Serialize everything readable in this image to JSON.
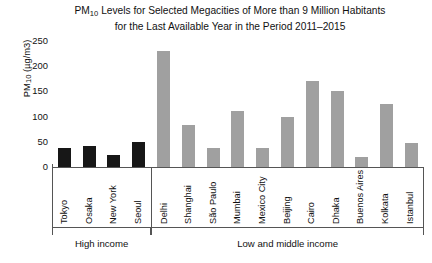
{
  "chart": {
    "title_line1_pre": "PM",
    "title_line1_sub": "10",
    "title_line1_post": " Levels for Selected Megacities of More than 9 Million Habitants",
    "title_line2": "for the Last Available Year in the Period 2011–2015",
    "y_axis_label_pre": "PM",
    "y_axis_label_sub": "10",
    "y_axis_label_post": " (µg/m3)",
    "colors": {
      "high_income_bar": "#171717",
      "low_middle_income_bar": "#a0a0a0",
      "axis": "#555555",
      "text": "#111111",
      "background": "#ffffff"
    }
  },
  "chart_data": {
    "type": "bar",
    "xlabel": "",
    "ylabel": "PM10 (µg/m3)",
    "ylim": [
      0,
      250
    ],
    "yticks": [
      0,
      50,
      100,
      150,
      200,
      250
    ],
    "grid": false,
    "legend": "none",
    "categories": [
      "Tokyo",
      "Osaka",
      "New York",
      "Seoul",
      "Delhi",
      "Shanghai",
      "São Paulo",
      "Mumbai",
      "Mexico City",
      "Beijing",
      "Cairo",
      "Dhaka",
      "Buenos Aires",
      "Kolkata",
      "Istanbul"
    ],
    "values": [
      38,
      42,
      24,
      50,
      230,
      83,
      38,
      111,
      38,
      100,
      170,
      150,
      20,
      125,
      48
    ],
    "groups": [
      {
        "label": "High income",
        "count": 4,
        "color": "#171717"
      },
      {
        "label": "Low and middle income",
        "count": 11,
        "color": "#a0a0a0"
      }
    ],
    "bars": [
      {
        "city": "Tokyo",
        "value": 38,
        "group": "High income"
      },
      {
        "city": "Osaka",
        "value": 42,
        "group": "High income"
      },
      {
        "city": "New York",
        "value": 24,
        "group": "High income"
      },
      {
        "city": "Seoul",
        "value": 50,
        "group": "High income"
      },
      {
        "city": "Delhi",
        "value": 230,
        "group": "Low and middle income"
      },
      {
        "city": "Shanghai",
        "value": 83,
        "group": "Low and middle income"
      },
      {
        "city": "São Paulo",
        "value": 38,
        "group": "Low and middle income"
      },
      {
        "city": "Mumbai",
        "value": 111,
        "group": "Low and middle income"
      },
      {
        "city": "Mexico City",
        "value": 38,
        "group": "Low and middle income"
      },
      {
        "city": "Beijing",
        "value": 100,
        "group": "Low and middle income"
      },
      {
        "city": "Cairo",
        "value": 170,
        "group": "Low and middle income"
      },
      {
        "city": "Dhaka",
        "value": 150,
        "group": "Low and middle income"
      },
      {
        "city": "Buenos Aires",
        "value": 20,
        "group": "Low and middle income"
      },
      {
        "city": "Kolkata",
        "value": 125,
        "group": "Low and middle income"
      },
      {
        "city": "Istanbul",
        "value": 48,
        "group": "Low and middle income"
      }
    ]
  }
}
